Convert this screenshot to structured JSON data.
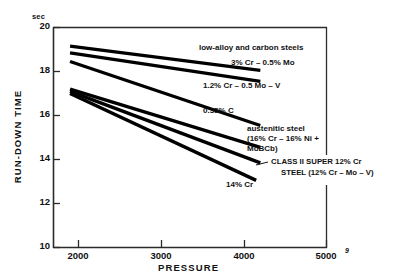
{
  "chart_data": {
    "type": "line",
    "title": "",
    "xlabel": "PRESSURE",
    "ylabel": "RUN-DOWN TIME",
    "yunit": "sec",
    "xlim": [
      1700,
      5000
    ],
    "ylim": [
      10,
      20
    ],
    "xticks": [
      2000,
      3000,
      4000,
      5000
    ],
    "yticks": [
      10,
      12,
      14,
      16,
      18,
      20
    ],
    "xticklabels": [
      "2000",
      "3000",
      "4000",
      "5000"
    ],
    "yticklabels": [
      "10",
      "12",
      "14",
      "16",
      "18",
      "20"
    ],
    "grid": false,
    "legend_position": "inline-right-annotations",
    "group_heading": "low-alloy and carbon steels",
    "series": [
      {
        "name": "3% Cr – 0.5% Mo",
        "label": "3% Cr – 0.5% Mo",
        "x": [
          1900,
          4200
        ],
        "y": [
          19.15,
          18.05
        ]
      },
      {
        "name": "1.2% Cr – 0.5 Mo – V",
        "label": "1.2% Cr – 0.5 Mo – V",
        "x": [
          1900,
          4200
        ],
        "y": [
          18.85,
          17.55
        ]
      },
      {
        "name": "0.35% C",
        "label": "0.35% C",
        "x": [
          1900,
          4200
        ],
        "y": [
          18.45,
          15.55
        ]
      },
      {
        "name": "austenitic steel (16% Cr – 16% Ni + MoBCb)",
        "label_line1": "austenitic steel",
        "label_line2": "(16% Cr – 16% Ni +",
        "label_line3": "MoBCb)",
        "x": [
          1900,
          4200
        ],
        "y": [
          17.2,
          14.55
        ]
      },
      {
        "name": "CLASS II SUPER 12% Cr STEEL (12% Cr – Mo – V)",
        "label_line1": "CLASS II SUPER 12% Cr",
        "label_line2": "STEEL (12% Cr – Mo – V)",
        "x": [
          1900,
          4200
        ],
        "y": [
          17.1,
          13.85
        ]
      },
      {
        "name": "14% Cr",
        "label": "14% Cr",
        "x": [
          1900,
          4150
        ],
        "y": [
          17.0,
          13.05
        ]
      }
    ],
    "annotations": {
      "axis_corner_mark": "9"
    }
  }
}
